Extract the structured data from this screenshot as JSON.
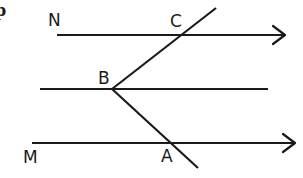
{
  "figure": {
    "corner_mark": "p",
    "labels": {
      "N": "N",
      "C": "C",
      "B": "B",
      "M": "M",
      "A": "A"
    },
    "lines": [
      {
        "name": "line-NC",
        "x1": 57,
        "y1": 35,
        "x2": 284,
        "y2": 35,
        "arrow": true
      },
      {
        "name": "line-through-B",
        "x1": 40,
        "y1": 89,
        "x2": 268,
        "y2": 89,
        "arrow": false
      },
      {
        "name": "line-MA",
        "x1": 32,
        "y1": 143,
        "x2": 294,
        "y2": 143,
        "arrow": true
      },
      {
        "name": "segment-BC",
        "x1": 112,
        "y1": 89,
        "x2": 216,
        "y2": 8,
        "arrow": false
      },
      {
        "name": "segment-BA",
        "x1": 112,
        "y1": 89,
        "x2": 198,
        "y2": 168,
        "arrow": false
      }
    ],
    "colors": {
      "stroke": "#1a1a1a",
      "background": "#ffffff"
    }
  }
}
